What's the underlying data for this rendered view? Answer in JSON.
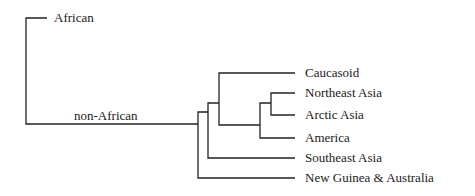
{
  "diagram": {
    "type": "phylogenetic-tree",
    "line_color": "#222222",
    "root_branches": {
      "african": "African",
      "non_african": "non-African"
    },
    "leaves": [
      "Caucasoid",
      "Northeast Asia",
      "Arctic Asia",
      "America",
      "Southeast Asia",
      "New Guinea & Australia"
    ]
  }
}
